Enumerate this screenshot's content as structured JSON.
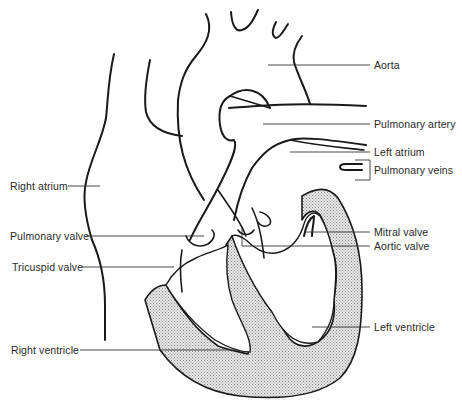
{
  "diagram": {
    "colors": {
      "line": "#1a1a1a",
      "muscle_fill": "#d9d9d9",
      "background": "#ffffff",
      "label_text": "#2a2a2a"
    },
    "labels": {
      "aorta": "Aorta",
      "pulmonary_artery": "Pulmonary artery",
      "left_atrium": "Left atrium",
      "pulmonary_veins": "Pulmonary veins",
      "right_atrium": "Right atrium",
      "mitral_valve": "Mitral valve",
      "aortic_valve": "Aortic valve",
      "pulmonary_valve": "Pulmonary valve",
      "tricuspid_valve": "Tricuspid valve",
      "left_ventricle": "Left ventricle",
      "right_ventricle": "Right ventricle"
    }
  }
}
